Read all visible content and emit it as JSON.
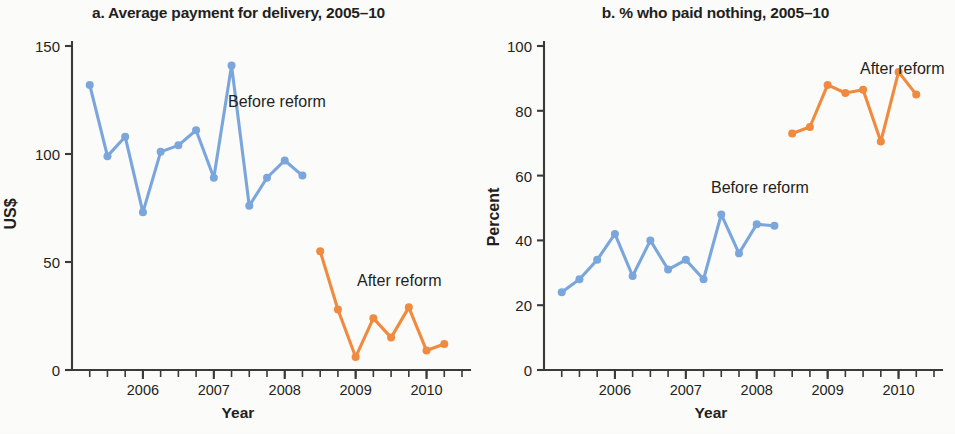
{
  "figure": {
    "panel_a": {
      "title": "a. Average payment for delivery, 2005–10",
      "ylabel": "US$",
      "xlabel": "Year",
      "label_before": "Before reform",
      "label_after": "After reform",
      "ytick_labels": [
        "0",
        "50",
        "100",
        "150"
      ],
      "xtick_labels": [
        "2006",
        "2007",
        "2008",
        "2009",
        "2010"
      ]
    },
    "panel_b": {
      "title": "b. % who paid nothing, 2005–10",
      "ylabel": "Percent",
      "xlabel": "Year",
      "label_before": "Before reform",
      "label_after": "After reform",
      "ytick_labels": [
        "0",
        "20",
        "40",
        "60",
        "80",
        "100"
      ],
      "xtick_labels": [
        "2006",
        "2007",
        "2008",
        "2009",
        "2010"
      ]
    }
  },
  "colors": {
    "before_reform": "#7aa6dc",
    "after_reform": "#f08a3f",
    "text": "#231f20",
    "axis": "#3a3a3a",
    "background": "#fbfbfa"
  },
  "chart_data": [
    {
      "type": "line",
      "panel": "a",
      "title": "a. Average payment for delivery, 2005–10",
      "xlabel": "Year",
      "ylabel": "US$",
      "xlim": [
        2005.0,
        2010.5
      ],
      "ylim": [
        0,
        150
      ],
      "yticks": [
        0,
        50,
        100,
        150
      ],
      "xticks": [
        2006,
        2007,
        2008,
        2009,
        2010
      ],
      "minor_xticks_interval": 0.25,
      "grid": false,
      "legend": "inline-annotations",
      "series": [
        {
          "name": "Before reform",
          "color": "#7aa6dc",
          "x": [
            2005.25,
            2005.5,
            2005.75,
            2006.0,
            2006.25,
            2006.5,
            2006.75,
            2007.0,
            2007.25,
            2007.5,
            2007.75,
            2008.0,
            2008.25
          ],
          "values": [
            132,
            99,
            108,
            73,
            101,
            104,
            111,
            89,
            141,
            76,
            89,
            97,
            90
          ]
        },
        {
          "name": "After reform",
          "color": "#f08a3f",
          "x": [
            2008.5,
            2008.75,
            2009.0,
            2009.25,
            2009.5,
            2009.75,
            2010.0,
            2010.25
          ],
          "values": [
            55,
            28,
            6,
            24,
            15,
            29,
            9,
            12
          ]
        }
      ]
    },
    {
      "type": "line",
      "panel": "b",
      "title": "b. % who paid nothing, 2005–10",
      "xlabel": "Year",
      "ylabel": "Percent",
      "xlim": [
        2005.0,
        2010.5
      ],
      "ylim": [
        0,
        100
      ],
      "yticks": [
        0,
        20,
        40,
        60,
        80,
        100
      ],
      "xticks": [
        2006,
        2007,
        2008,
        2009,
        2010
      ],
      "minor_xticks_interval": 0.25,
      "grid": false,
      "legend": "inline-annotations",
      "series": [
        {
          "name": "Before reform",
          "color": "#7aa6dc",
          "x": [
            2005.25,
            2005.5,
            2005.75,
            2006.0,
            2006.25,
            2006.5,
            2006.75,
            2007.0,
            2007.25,
            2007.5,
            2007.75,
            2008.0,
            2008.25
          ],
          "values": [
            24,
            28,
            34,
            42,
            29,
            40,
            31,
            34,
            28,
            48,
            36,
            45,
            44.5
          ]
        },
        {
          "name": "After reform",
          "color": "#f08a3f",
          "x": [
            2008.5,
            2008.75,
            2009.0,
            2009.25,
            2009.5,
            2009.75,
            2010.0,
            2010.25
          ],
          "values": [
            73,
            75,
            88,
            85.5,
            86.5,
            70.5,
            92,
            85
          ]
        }
      ]
    }
  ]
}
